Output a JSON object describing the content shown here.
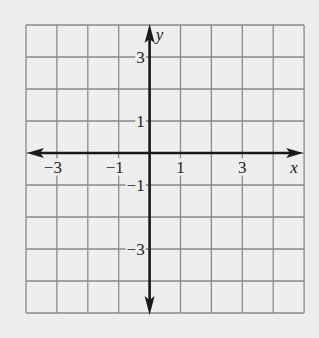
{
  "chart_data": {
    "type": "coordinate-grid",
    "title": "",
    "xlabel": "x",
    "ylabel": "y",
    "xlim": [
      -4,
      5
    ],
    "ylim": [
      -5,
      4
    ],
    "grid": true,
    "grid_step": 1,
    "x_ticks_labeled": [
      {
        "value": -3,
        "label": "−3"
      },
      {
        "value": -1,
        "label": "−1"
      },
      {
        "value": 1,
        "label": "1"
      },
      {
        "value": 3,
        "label": "3"
      }
    ],
    "y_ticks_labeled": [
      {
        "value": 3,
        "label": "3"
      },
      {
        "value": 1,
        "label": "1"
      },
      {
        "value": -1,
        "label": "−1"
      },
      {
        "value": -3,
        "label": "−3"
      }
    ],
    "series": []
  },
  "style": {
    "background": "#eeeeee",
    "grid_color": "#8a8a8a",
    "axis_color": "#1a1a1a",
    "label_color": "#222222"
  },
  "layout": {
    "left": 26,
    "top": 25,
    "cell_w": 30.9,
    "cell_h": 32,
    "cols": 9,
    "rows": 9
  }
}
